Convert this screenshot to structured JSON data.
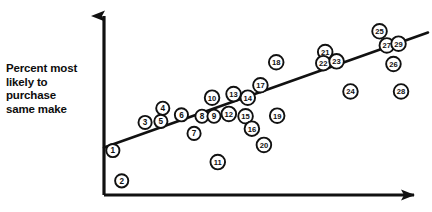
{
  "figure": {
    "type": "scatter-plot",
    "background_color": "#ffffff",
    "ink_color": "#111111",
    "marker_fill": "#ffffff"
  },
  "axes": {
    "y_axis": {
      "name": "y-axis",
      "label": "Percent most\nlikely to\npurchase\nsame make",
      "label_lines": [
        "Percent most",
        "likely to",
        "purchase",
        "same make"
      ],
      "has_arrowhead": true,
      "tick_labels": []
    },
    "x_axis": {
      "name": "x-axis",
      "label": "",
      "has_arrowhead": true,
      "tick_labels": []
    }
  },
  "trend_line": {
    "name": "fitted-trend-line",
    "visible": true,
    "direction": "increasing"
  },
  "chart_data": {
    "type": "scatter",
    "title": "",
    "subtitle": "",
    "xlabel": "",
    "ylabel": "Percent most likely to purchase same make",
    "xlim": [
      0,
      100
    ],
    "ylim": [
      0,
      100
    ],
    "grid": false,
    "legend": null,
    "axis_ticks_shown": false,
    "point_label_style": "circled-number",
    "series": [
      {
        "name": "observations",
        "marker": "circled-number",
        "points": [
          {
            "label": "1",
            "x": 2.8,
            "y": 25.1
          },
          {
            "label": "2",
            "x": 5.6,
            "y": 8.0
          },
          {
            "label": "3",
            "x": 13.0,
            "y": 41.0
          },
          {
            "label": "4",
            "x": 18.6,
            "y": 49.0
          },
          {
            "label": "5",
            "x": 18.0,
            "y": 41.6
          },
          {
            "label": "6",
            "x": 24.5,
            "y": 45.3
          },
          {
            "label": "7",
            "x": 28.5,
            "y": 34.8
          },
          {
            "label": "8",
            "x": 31.0,
            "y": 44.5
          },
          {
            "label": "9",
            "x": 34.8,
            "y": 44.5
          },
          {
            "label": "10",
            "x": 34.2,
            "y": 55.0
          },
          {
            "label": "11",
            "x": 36.0,
            "y": 18.6
          },
          {
            "label": "12",
            "x": 39.5,
            "y": 45.8
          },
          {
            "label": "13",
            "x": 41.0,
            "y": 57.0
          },
          {
            "label": "14",
            "x": 45.5,
            "y": 55.0
          },
          {
            "label": "15",
            "x": 44.8,
            "y": 44.5
          },
          {
            "label": "16",
            "x": 46.8,
            "y": 37.5
          },
          {
            "label": "17",
            "x": 49.5,
            "y": 62.0
          },
          {
            "label": "18",
            "x": 54.5,
            "y": 75.0
          },
          {
            "label": "19",
            "x": 54.8,
            "y": 44.8
          },
          {
            "label": "20",
            "x": 50.6,
            "y": 28.3
          },
          {
            "label": "21",
            "x": 70.0,
            "y": 80.8
          },
          {
            "label": "22",
            "x": 69.4,
            "y": 74.5
          },
          {
            "label": "23",
            "x": 73.6,
            "y": 75.5
          },
          {
            "label": "24",
            "x": 78.0,
            "y": 58.5
          },
          {
            "label": "25",
            "x": 87.2,
            "y": 92.5
          },
          {
            "label": "26",
            "x": 91.6,
            "y": 74.0
          },
          {
            "label": "27",
            "x": 89.5,
            "y": 84.5
          },
          {
            "label": "28",
            "x": 94.0,
            "y": 58.5
          },
          {
            "label": "29",
            "x": 93.2,
            "y": 85.5
          }
        ]
      }
    ],
    "trend_line": {
      "name": "fitted line",
      "x": [
        0,
        100
      ],
      "y": [
        28.5,
        89.0
      ]
    },
    "annotations": []
  }
}
